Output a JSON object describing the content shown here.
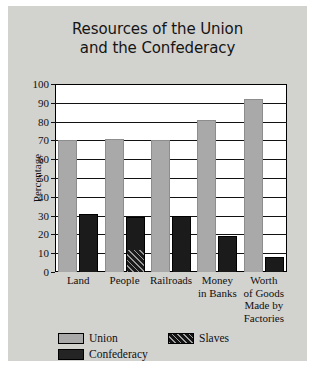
{
  "card": {
    "background_color": "#d2d2cf"
  },
  "chart_data": {
    "type": "bar",
    "title": "Resources of the Union and the Confederacy",
    "title_line1": "Resources of the Union",
    "title_line2": "and the Confederacy",
    "xlabel": "",
    "ylabel": "Percentage",
    "ylim": [
      0,
      100
    ],
    "ytick_step": 10,
    "yticks": [
      0,
      10,
      20,
      30,
      40,
      50,
      60,
      70,
      80,
      90,
      100
    ],
    "grid": true,
    "legend_position": "bottom-left",
    "categories": [
      "Land",
      "People",
      "Railroads",
      "Money in Banks",
      "Worth of Goods Made by Factories"
    ],
    "category_lines": [
      [
        "Land"
      ],
      [
        "People"
      ],
      [
        "Railroads"
      ],
      [
        "Money",
        "in Banks"
      ],
      [
        "Worth",
        "of Goods",
        "Made by",
        "Factories"
      ]
    ],
    "series": [
      {
        "name": "Union",
        "color": "#a9a9a9",
        "values": [
          70,
          71,
          70,
          81,
          92
        ]
      },
      {
        "name": "Confederacy",
        "color": "#1b1b1b",
        "values": [
          31,
          29,
          30,
          19,
          8
        ]
      },
      {
        "name": "Slaves",
        "color": "#141414",
        "pattern": "diagonal-hatch",
        "values": [
          0,
          12,
          0,
          0,
          0
        ]
      }
    ]
  },
  "legend": {
    "entries": [
      {
        "label": "Union",
        "swatch": "union-swatch"
      },
      {
        "label": "Slaves",
        "swatch": "slaves-swatch"
      },
      {
        "label": "Confederacy",
        "swatch": "confederacy-swatch"
      }
    ]
  }
}
